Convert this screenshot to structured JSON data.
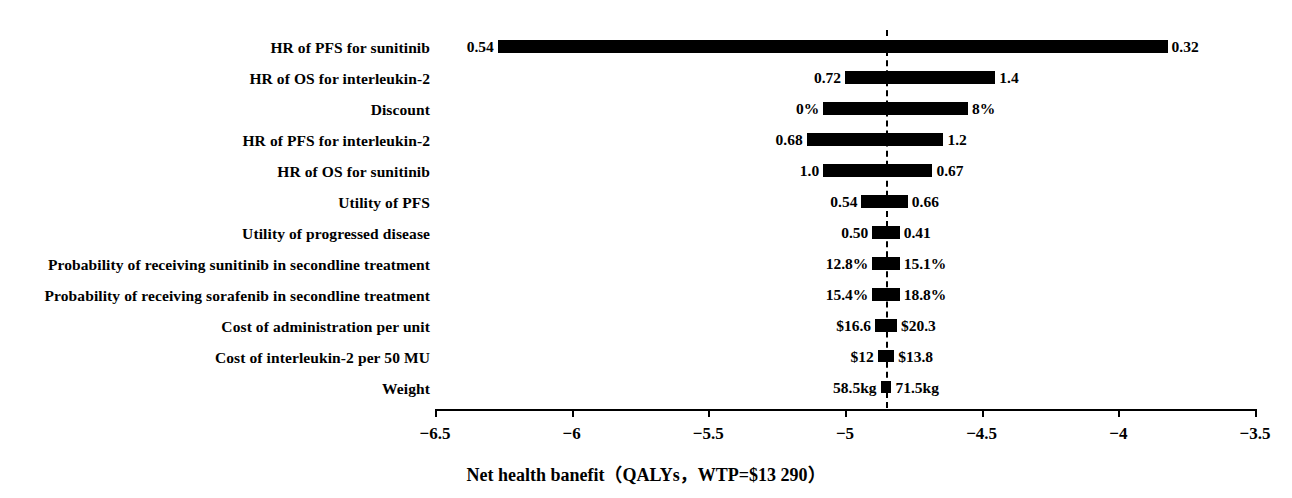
{
  "chart_data": {
    "type": "bar",
    "chart_kind": "tornado",
    "title": "",
    "xlabel": "Net health banefit（QALYs，WTP=$13 290）",
    "ylabel": "",
    "xlim": [
      -6.5,
      -3.5
    ],
    "xticks": [
      -6.5,
      -6,
      -5.5,
      -5,
      -4.5,
      -4,
      -3.5
    ],
    "xtick_labels": [
      "−6.5",
      "−6",
      "−5.5",
      "−5",
      "−4.5",
      "−4",
      "−3.5"
    ],
    "grid": false,
    "legend": null,
    "baseline_value": -4.85,
    "categories": [
      "HR of PFS for sunitinib",
      "HR of OS for interleukin-2",
      "Discount",
      "HR of PFS for interleukin-2",
      "HR of OS for sunitinib",
      "Utility of PFS",
      "Utility of progressed disease",
      "Probability of receiving sunitinib in secondline treatment",
      "Probability of receiving sorafenib in secondline treatment",
      "Cost of administration per unit",
      "Cost of interleukin-2 per 50 MU",
      "Weight",
      "HR of PFS for sunitinib"
    ],
    "bars": [
      {
        "label": "HR of PFS for sunitinib",
        "low_label": "0.54",
        "high_label": "0.32",
        "x_start": -6.27,
        "x_end": -3.82
      },
      {
        "label": "HR of OS for interleukin-2",
        "low_label": "0.72",
        "high_label": "1.4",
        "x_start": -5.0,
        "x_end": -4.45
      },
      {
        "label": "Discount",
        "low_label": "0%",
        "high_label": "8%",
        "x_start": -5.08,
        "x_end": -4.55
      },
      {
        "label": "HR of PFS for interleukin-2",
        "low_label": "0.68",
        "high_label": "1.2",
        "x_start": -5.14,
        "x_end": -4.64
      },
      {
        "label": "HR of OS for sunitinib",
        "low_label": "1.0",
        "high_label": "0.67",
        "x_start": -5.08,
        "x_end": -4.68
      },
      {
        "label": "Utility of PFS",
        "low_label": "0.54",
        "high_label": "0.66",
        "x_start": -4.94,
        "x_end": -4.77
      },
      {
        "label": "Utility of progressed disease",
        "low_label": "0.50",
        "high_label": "0.41",
        "x_start": -4.9,
        "x_end": -4.8
      },
      {
        "label": "Probability of receiving sunitinib in secondline treatment",
        "low_label": "12.8%",
        "high_label": "15.1%",
        "x_start": -4.9,
        "x_end": -4.8
      },
      {
        "label": "Probability of receiving sorafenib in secondline treatment",
        "low_label": "15.4%",
        "high_label": "18.8%",
        "x_start": -4.9,
        "x_end": -4.8
      },
      {
        "label": "Cost of administration per unit",
        "low_label": "$16.6",
        "high_label": "$20.3",
        "x_start": -4.89,
        "x_end": -4.81
      },
      {
        "label": "Cost of interleukin-2 per 50 MU",
        "low_label": "$12",
        "high_label": "$13.8",
        "x_start": -4.88,
        "x_end": -4.82
      },
      {
        "label": "Weight",
        "low_label": "58.5kg",
        "high_label": "71.5kg",
        "x_start": -4.87,
        "x_end": -4.83
      }
    ]
  }
}
